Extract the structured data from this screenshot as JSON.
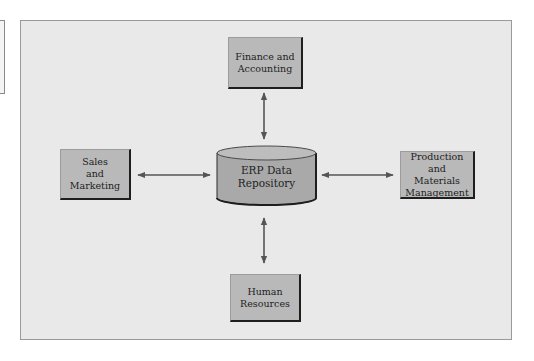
{
  "diagram": {
    "center": {
      "label": "ERP Data\nRepository",
      "shape": "cylinder"
    },
    "nodes": [
      {
        "id": "finance",
        "label": "Finance and\nAccounting",
        "position": "top"
      },
      {
        "id": "sales",
        "label": "Sales\nand\nMarketing",
        "position": "left"
      },
      {
        "id": "production",
        "label": "Production and\nMaterials\nManagement",
        "position": "right"
      },
      {
        "id": "hr",
        "label": "Human\nResources",
        "position": "bottom"
      }
    ],
    "edges": [
      {
        "from": "finance",
        "to": "center",
        "direction": "bidirectional"
      },
      {
        "from": "sales",
        "to": "center",
        "direction": "bidirectional"
      },
      {
        "from": "production",
        "to": "center",
        "direction": "bidirectional"
      },
      {
        "from": "hr",
        "to": "center",
        "direction": "bidirectional"
      }
    ],
    "colors": {
      "background": "#e9e9e9",
      "box_fill": "#b9b9b9",
      "cylinder_body": "#a9a9a9",
      "cylinder_top": "#bdbdbd",
      "arrow": "#555555"
    }
  }
}
